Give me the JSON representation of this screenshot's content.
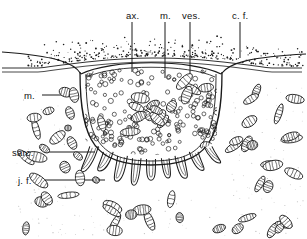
{
  "figure": {
    "background_color": "#ffffff",
    "ink_color": "#1a1a1a",
    "width": 307,
    "height": 239
  },
  "labels": {
    "top": [
      {
        "id": "ax",
        "text": "ax.",
        "x": 126,
        "y": 10,
        "leader_x": 132,
        "leader_y1": 22,
        "leader_y2": 72,
        "meaning": "axon terminal"
      },
      {
        "id": "m_top",
        "text": "m.",
        "x": 160,
        "y": 10,
        "leader_x": 165,
        "leader_y1": 22,
        "leader_y2": 78,
        "meaning": "mitochondrion"
      },
      {
        "id": "ves",
        "text": "ves.",
        "x": 182,
        "y": 10,
        "leader_x": 190,
        "leader_y1": 22,
        "leader_y2": 80,
        "meaning": "synaptic vesicles"
      },
      {
        "id": "cf",
        "text": "c. f.",
        "x": 232,
        "y": 10,
        "leader_x": 240,
        "leader_y1": 22,
        "leader_y2": 58,
        "meaning": "collagen fibres"
      }
    ],
    "left": [
      {
        "id": "m_left",
        "text": "m.",
        "x": 24,
        "y": 90,
        "leader_x1": 42,
        "leader_x2": 78,
        "leader_y": 95,
        "meaning": "mitochondrion"
      },
      {
        "id": "sarc",
        "text": "sarc.",
        "x": 12,
        "y": 147,
        "leader_x1": 44,
        "leader_x2": 95,
        "leader_y": 152,
        "meaning": "sarcoplasm"
      },
      {
        "id": "jf",
        "text": "j. f.",
        "x": 18,
        "y": 175,
        "leader_x1": 42,
        "leader_x2": 105,
        "leader_y": 180,
        "meaning": "junctional folds"
      }
    ]
  },
  "structures": {
    "connective_tissue_band": {
      "name": "c. f. stipple band",
      "y_top": 42,
      "y_bottom": 72
    },
    "axon_terminal_cup": {
      "name": "axon terminal",
      "left": 80,
      "right": 222,
      "top": 68,
      "bottom": 165
    },
    "junctional_folds": {
      "name": "junctional folds",
      "count": 9,
      "y": 165,
      "depth": 30
    },
    "sarcoplasm_field": {
      "name": "sarcoplasm with mitochondria"
    }
  },
  "counts": {
    "vesicles_in_terminal": 210,
    "mitochondria_in_terminal": 17,
    "mitochondria_in_sarcoplasm": 46,
    "stipple_dots": 320
  }
}
